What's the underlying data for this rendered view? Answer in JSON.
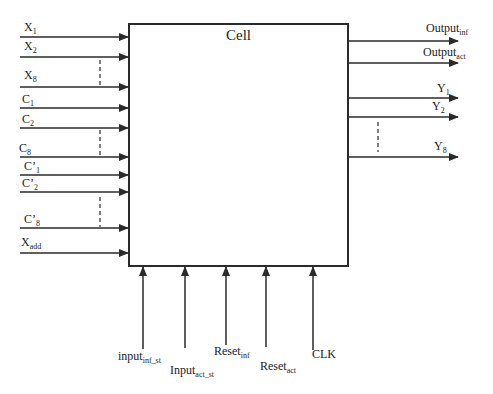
{
  "cell": {
    "title": "Cell"
  },
  "inputs_left": [
    {
      "base": "X",
      "sub": "1",
      "y": 37,
      "lx": 24,
      "ly": 21
    },
    {
      "base": "X",
      "sub": "2",
      "y": 57,
      "lx": 24,
      "ly": 40
    },
    {
      "base": "X",
      "sub": "8",
      "y": 87,
      "lx": 24,
      "ly": 69
    },
    {
      "base": "C",
      "sub": "1",
      "y": 108,
      "lx": 22,
      "ly": 93
    },
    {
      "base": "C",
      "sub": "2",
      "y": 128,
      "lx": 22,
      "ly": 113
    },
    {
      "base": "C",
      "sub": "8",
      "y": 157,
      "lx": 19,
      "ly": 142
    },
    {
      "base": "C’",
      "sub": "1",
      "y": 175,
      "lx": 24,
      "ly": 160
    },
    {
      "base": "C’",
      "sub": "2",
      "y": 192,
      "lx": 22,
      "ly": 177
    },
    {
      "base": "C’",
      "sub": "8",
      "y": 228,
      "lx": 24,
      "ly": 213
    },
    {
      "base": "X",
      "sub": "add",
      "y": 253,
      "lx": 21,
      "ly": 236
    }
  ],
  "outputs_right": [
    {
      "base": "Output",
      "sub": "inf",
      "y": 41,
      "lx": 426,
      "ly": 22
    },
    {
      "base": "Output",
      "sub": "act",
      "y": 63,
      "lx": 423,
      "ly": 46
    },
    {
      "base": "Y",
      "sub": "1",
      "y": 98,
      "lx": 437,
      "ly": 82
    },
    {
      "base": "Y",
      "sub": "2",
      "y": 117,
      "lx": 432,
      "ly": 100
    },
    {
      "base": "Y",
      "sub": "8",
      "y": 157,
      "lx": 434,
      "ly": 140
    }
  ],
  "inputs_bottom": [
    {
      "base": "input",
      "sub": "inf_st",
      "x": 143,
      "yend": 349,
      "lx": 118,
      "ly": 350
    },
    {
      "base": "Input",
      "sub": "act_st",
      "x": 185,
      "yend": 348,
      "lx": 170,
      "ly": 364
    },
    {
      "base": "Reset",
      "sub": "inf",
      "x": 226,
      "yend": 345,
      "lx": 214,
      "ly": 345
    },
    {
      "base": "Reset",
      "sub": "act",
      "x": 266,
      "yend": 347,
      "lx": 260,
      "ly": 360
    },
    {
      "base": "CLK",
      "sub": "",
      "x": 313,
      "yend": 350,
      "lx": 312,
      "ly": 348
    }
  ],
  "ellipsis_markers": [
    {
      "side": "left",
      "x": 100,
      "y1": 60,
      "y2": 86
    },
    {
      "side": "left",
      "x": 100,
      "y1": 130,
      "y2": 156
    },
    {
      "side": "left",
      "x": 100,
      "y1": 197,
      "y2": 227
    },
    {
      "side": "right",
      "x": 378,
      "y1": 122,
      "y2": 152
    }
  ],
  "colors": {
    "line": "#2a2a2a",
    "box_border": "#2a2a2a",
    "background": "#ffffff"
  }
}
